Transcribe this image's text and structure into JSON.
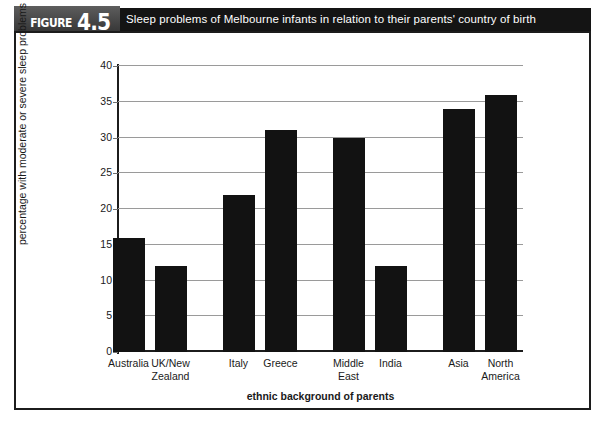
{
  "figure": {
    "tag_word": "FIGURE",
    "tag_number": "4.5",
    "title": "Sleep problems of Melbourne infants in relation to their parents' country of birth"
  },
  "colors": {
    "bar": "#121212",
    "grid": "#9a9a9a",
    "axis": "#1c1c1c",
    "banner": "#141414",
    "tag_gray": "#4a4a4a"
  },
  "chart_data": {
    "type": "bar",
    "title": "Sleep problems of Melbourne infants in relation to their parents' country of birth",
    "xlabel": "ethnic background of parents",
    "ylabel": "percentage with moderate or severe sleep problems",
    "categories": [
      "Australia",
      "UK/New Zealand",
      "Italy",
      "Greece",
      "Middle East",
      "India",
      "Asia",
      "North America"
    ],
    "category_lines": [
      [
        "Australia"
      ],
      [
        "UK/New",
        "Zealand"
      ],
      [
        "Italy"
      ],
      [
        "Greece"
      ],
      [
        "Middle",
        "East"
      ],
      [
        "India"
      ],
      [
        "Asia"
      ],
      [
        "North",
        "America"
      ]
    ],
    "values": [
      16,
      12,
      22,
      31,
      30,
      12,
      34,
      36
    ],
    "ylim": [
      0,
      40
    ],
    "yticks": [
      0,
      5,
      10,
      15,
      20,
      25,
      30,
      35,
      40
    ],
    "ytick_labels": [
      "0",
      "5",
      "10",
      "15",
      "20",
      "25",
      "30",
      "35",
      "40"
    ],
    "grid": true,
    "legend": null,
    "bar_groups": [
      [
        "Australia",
        "UK/New Zealand"
      ],
      [
        "Italy",
        "Greece"
      ],
      [
        "Middle East",
        "India"
      ],
      [
        "Asia",
        "North America"
      ]
    ]
  }
}
